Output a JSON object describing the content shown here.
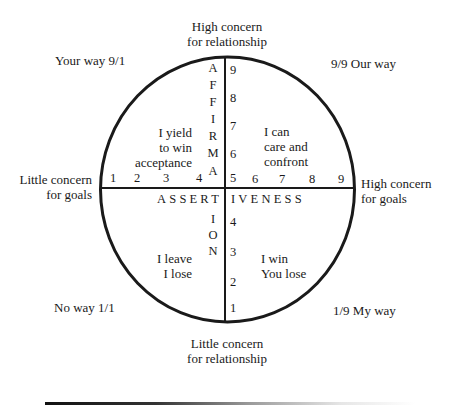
{
  "diagram": {
    "top_label": [
      "High concern",
      "for relationship"
    ],
    "bottom_label": [
      "Little concern",
      "for relationship"
    ],
    "left_label": [
      "Little concern",
      "for goals"
    ],
    "right_label": [
      "High concern",
      "for goals"
    ],
    "corners": {
      "top_left": "Your way 9/1",
      "top_right": "9/9 Our way",
      "bottom_left": "No way 1/1",
      "bottom_right": "1/9 My way"
    },
    "quadrants": {
      "top_left": [
        "I yield",
        "to win",
        "acceptance"
      ],
      "top_right": [
        "I can",
        "care and",
        "confront"
      ],
      "bottom_left": [
        "I leave",
        "I lose"
      ],
      "bottom_right": [
        "I win",
        "You lose"
      ]
    },
    "vertical_axis_word_top": [
      "A",
      "F",
      "F",
      "I",
      "R",
      "M",
      "A"
    ],
    "vertical_axis_word_bottom": [
      "I",
      "O",
      "N"
    ],
    "horizontal_axis_word_left": "ASSERT",
    "horizontal_axis_word_right": "IVENESS",
    "vertical_scale_upper": [
      "9",
      "8",
      "7",
      "6",
      "5"
    ],
    "vertical_scale_lower": [
      "4",
      "3",
      "2",
      "1"
    ],
    "horizontal_scale_left": [
      "1",
      "2",
      "3",
      "4"
    ],
    "horizontal_scale_right": [
      "6",
      "7",
      "8",
      "9"
    ],
    "stroke_color": "#1a1a1a"
  }
}
